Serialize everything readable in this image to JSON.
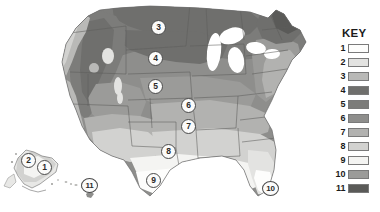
{
  "map": {
    "title": "United States plant hardiness zone map",
    "background_color": "#ffffff",
    "outline_color": "#6b6b6b",
    "markers": [
      {
        "id": "1",
        "label": "1",
        "x": 44,
        "y": 167,
        "region": "Alaska interior"
      },
      {
        "id": "2",
        "label": "2",
        "x": 28,
        "y": 160,
        "region": "Alaska north"
      },
      {
        "id": "3",
        "label": "3",
        "x": 158,
        "y": 27,
        "region": "North Dakota"
      },
      {
        "id": "4",
        "label": "4",
        "x": 155,
        "y": 58,
        "region": "South Dakota"
      },
      {
        "id": "5",
        "label": "5",
        "x": 155,
        "y": 86,
        "region": "Nebraska"
      },
      {
        "id": "6",
        "label": "6",
        "x": 188,
        "y": 105,
        "region": "Missouri"
      },
      {
        "id": "7",
        "label": "7",
        "x": 188,
        "y": 126,
        "region": "Arkansas"
      },
      {
        "id": "8",
        "label": "8",
        "x": 168,
        "y": 151,
        "region": "Texas north"
      },
      {
        "id": "9",
        "label": "9",
        "x": 153,
        "y": 180,
        "region": "Texas south"
      },
      {
        "id": "10",
        "label": "10",
        "x": 270,
        "y": 188,
        "region": "Florida south"
      },
      {
        "id": "11",
        "label": "11",
        "x": 89,
        "y": 185,
        "region": "Hawaii"
      }
    ]
  },
  "legend": {
    "title": "KEY",
    "entries": [
      {
        "number": "1",
        "color": "#fdfdfc"
      },
      {
        "number": "2",
        "color": "#e3e3e1"
      },
      {
        "number": "3",
        "color": "#b9b9b7"
      },
      {
        "number": "4",
        "color": "#6f6f6d"
      },
      {
        "number": "5",
        "color": "#7c7c7a"
      },
      {
        "number": "6",
        "color": "#8e8e8c"
      },
      {
        "number": "7",
        "color": "#b2b2b0"
      },
      {
        "number": "8",
        "color": "#d2d2d0"
      },
      {
        "number": "9",
        "color": "#f4f4f2"
      },
      {
        "number": "10",
        "color": "#9b9b99"
      },
      {
        "number": "11",
        "color": "#5a5a58"
      }
    ]
  }
}
